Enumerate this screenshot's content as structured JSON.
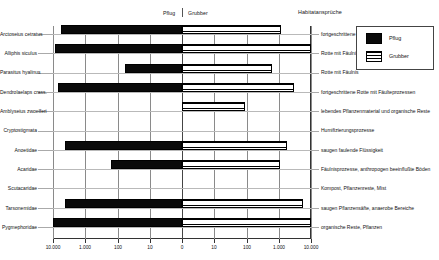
{
  "header": {
    "left_treatment": "Pflug",
    "right_treatment": "Grubber",
    "habitat_title": "Habitatansprüche"
  },
  "legend": {
    "items": [
      {
        "label": "Pflug",
        "pattern": "solid-black",
        "color": "#0a0a0a"
      },
      {
        "label": "Grubber",
        "pattern": "horizontal-stripes",
        "color": "#ffffff"
      }
    ]
  },
  "axis": {
    "type": "log-mirrored",
    "tick_labels": [
      "10.000",
      "1.000",
      "100",
      "10",
      "0",
      "10",
      "100",
      "1.000",
      "10.000"
    ],
    "decades_per_side": 4
  },
  "chart_data": {
    "type": "bar",
    "orientation": "horizontal-diverging",
    "title": "",
    "subtitle": "",
    "xlabel": "",
    "ylabel": "",
    "scale": "log",
    "xlim": [
      -10000,
      10000
    ],
    "grid": true,
    "legend_position": "top-right",
    "categories": [
      "Arctoseius cetratus",
      "Alliphis siculus",
      "Parasitus hyalinus",
      "Dendrolaelaps crass.",
      "Amblyseius zwoelferi",
      "Cryptostigmata",
      "Anoetidae",
      "Acaridae",
      "Scutacaridae",
      "Tarsonemidae",
      "Pygmephoridae"
    ],
    "series": [
      {
        "name": "Pflug",
        "values": [
          560,
          880,
          6,
          700,
          0,
          0,
          420,
          16,
          0,
          430,
          1600
        ]
      },
      {
        "name": "Grubber",
        "values": [
          120,
          2100,
          60,
          290,
          9,
          0,
          180,
          110,
          0,
          560,
          1500
        ]
      }
    ],
    "habitat_labels": [
      "fortgeschrittene Rotte",
      "Rotte mit Fäulnis",
      "Rotte mit Fäulnis",
      "fortgeschrittene Rotte mit Fäulteprozessen",
      "lebendes Pflanzenmaterial und organische Reste",
      "Humifizierungsprozesse",
      "saugen faulende Flüssigkeit",
      "Fäulnisprozesse, anthropogen beeinflußte Böden",
      "Kompost, Pflanzenreste, Mist",
      "saugen Pflanzensäfte, anaerobe Bereiche",
      "organische Reste, Pflanzen"
    ]
  }
}
